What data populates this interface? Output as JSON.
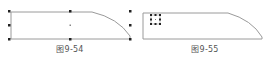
{
  "figures": [
    {
      "id": "fig-9-54",
      "caption": "图9-54",
      "caption_x": 70,
      "state": "shape selected with 8 resize handles and center point"
    },
    {
      "id": "fig-9-55",
      "caption": "图9-55",
      "caption_x": 205,
      "state": "small selection handle box inside shape"
    }
  ],
  "colors": {
    "outline": "#9a9a9a",
    "handle": "#222222",
    "caption": "#555555"
  }
}
